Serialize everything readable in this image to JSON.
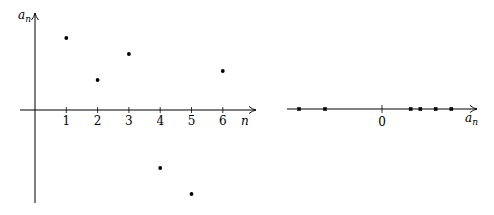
{
  "chart_data": [
    {
      "type": "scatter",
      "title": "",
      "xlabel": "n",
      "ylabel": "a_n",
      "x": [
        1,
        2,
        3,
        4,
        5,
        6
      ],
      "values": [
        72,
        30,
        56,
        -58,
        -84,
        39
      ],
      "x_tick_labels": [
        "1",
        "2",
        "3",
        "4",
        "5",
        "6"
      ],
      "xlim": [
        -0.5,
        7
      ],
      "ylim": [
        -95,
        97
      ],
      "grid": false,
      "legend": false,
      "units_note": "values in relative units (pixels above axis); no y tick labels shown"
    },
    {
      "type": "scatter",
      "title": "",
      "xlabel": "a_n",
      "ylabel": "",
      "x": [
        -84,
        -58,
        30,
        39,
        56,
        72
      ],
      "x_tick_labels": [
        "0"
      ],
      "description": "Number line showing the values a_n projected onto a single axis with origin 0",
      "grid": false,
      "legend": false
    }
  ],
  "left_plot": {
    "origin": {
      "x": 35,
      "y": 110
    },
    "unit_x": 31.3,
    "x_axis": {
      "x1": 20,
      "x2": 256,
      "label": "n"
    },
    "y_axis": {
      "y1": 203,
      "y2": 13,
      "label_main": "a",
      "label_sub": "n"
    },
    "ticks": [
      "1",
      "2",
      "3",
      "4",
      "5",
      "6"
    ],
    "points": [
      {
        "n": 1,
        "a": 72
      },
      {
        "n": 2,
        "a": 30
      },
      {
        "n": 3,
        "a": 56
      },
      {
        "n": 4,
        "a": -58
      },
      {
        "n": 5,
        "a": -84
      },
      {
        "n": 6,
        "a": 39
      }
    ]
  },
  "right_plot": {
    "origin": {
      "x": 382,
      "y": 109
    },
    "axis": {
      "x1": 287,
      "x2": 477
    },
    "zero_label": "0",
    "axis_label_main": "a",
    "axis_label_sub": "n",
    "points": [
      -83,
      -57,
      28.7,
      38.3,
      53.7,
      69.3
    ]
  },
  "colors": {
    "ink": "#000000",
    "background": "#ffffff"
  }
}
